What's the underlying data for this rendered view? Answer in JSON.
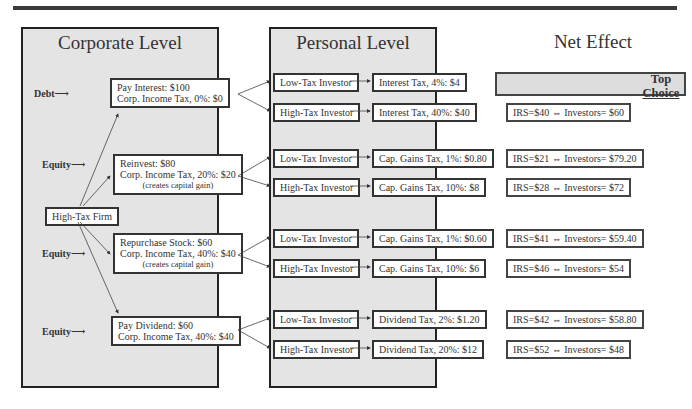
{
  "columns": {
    "corporate": "Corporate Level",
    "personal": "Personal Level",
    "net": "Net Effect"
  },
  "firm": "High-Tax Firm",
  "top_choice": [
    "Top",
    "Choice"
  ],
  "corporate": [
    {
      "side": "Debt",
      "lines": [
        "Pay Interest: $100",
        "Corp. Income Tax, 0%: $0"
      ],
      "note": ""
    },
    {
      "side": "Equity",
      "lines": [
        "Reinvest: $80",
        "Corp. Income Tax, 20%: $20"
      ],
      "note": "(creates capital gain)"
    },
    {
      "side": "Equity",
      "lines": [
        "Repurchase Stock: $60",
        "Corp. Income Tax, 40%: $40"
      ],
      "note": "(creates capital gain)"
    },
    {
      "side": "Equity",
      "lines": [
        "Pay Dividend: $60",
        "Corp. Income Tax, 40%: $40"
      ],
      "note": ""
    }
  ],
  "personal": [
    {
      "investor": "Low-Tax Investor",
      "tax": "Interest Tax, 4%:  $4",
      "net": "IRS= $4  ⇔  Investors=$96"
    },
    {
      "investor": "High-Tax Investor",
      "tax": "Interest Tax, 40%:  $40",
      "net": "IRS=$40  ⇔  Investors= $60"
    },
    {
      "investor": "Low-Tax Investor",
      "tax": "Cap. Gains Tax, 1%:  $0.80",
      "net": "IRS=$21  ⇔  Investors= $79.20"
    },
    {
      "investor": "High-Tax Investor",
      "tax": "Cap. Gains Tax, 10%: $8",
      "net": "IRS=$28  ⇔  Investors= $72"
    },
    {
      "investor": "Low-Tax Investor",
      "tax": "Cap. Gains Tax, 1%:  $0.60",
      "net": "IRS=$41  ⇔  Investors= $59.40"
    },
    {
      "investor": "High-Tax Investor",
      "tax": "Cap. Gains Tax, 10%:  $6",
      "net": "IRS=$46  ⇔  Investors= $54"
    },
    {
      "investor": "Low-Tax Investor",
      "tax": "Dividend Tax, 2%:  $1.20",
      "net": "IRS=$42  ⇔  Investors= $58.80"
    },
    {
      "investor": "High-Tax Investor",
      "tax": "Dividend Tax, 20%: $12",
      "net": "IRS=$52  ⇔  Investors= $48"
    }
  ]
}
